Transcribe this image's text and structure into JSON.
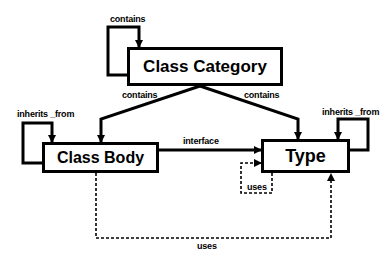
{
  "diagram": {
    "nodes": {
      "class_category": {
        "label": "Class Category"
      },
      "class_body": {
        "label": "Class Body"
      },
      "type": {
        "label": "Type"
      }
    },
    "edges": {
      "category_self": {
        "label": "contains",
        "from": "Class Category",
        "to": "Class Category",
        "style": "solid"
      },
      "category_to_body": {
        "label": "contains",
        "from": "Class Category",
        "to": "Class Body",
        "style": "solid"
      },
      "category_to_type": {
        "label": "contains",
        "from": "Class Category",
        "to": "Type",
        "style": "solid"
      },
      "body_self": {
        "label": "inherits _from",
        "from": "Class Body",
        "to": "Class Body",
        "style": "solid"
      },
      "type_self": {
        "label": "inherits _from",
        "from": "Type",
        "to": "Type",
        "style": "solid"
      },
      "body_to_type_interface": {
        "label": "interface",
        "from": "Class Body",
        "to": "Type",
        "style": "solid"
      },
      "type_self_uses": {
        "label": "uses",
        "from": "Type",
        "to": "Type",
        "style": "dashed"
      },
      "body_to_type_uses": {
        "label": "uses",
        "from": "Class Body",
        "to": "Type",
        "style": "dashed"
      }
    }
  }
}
